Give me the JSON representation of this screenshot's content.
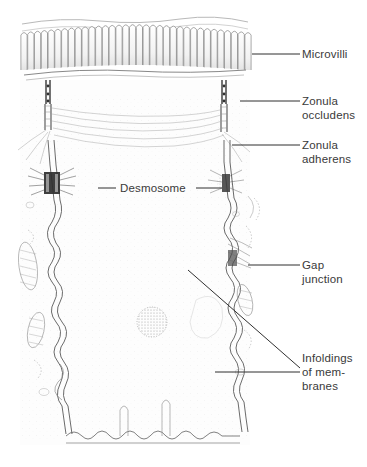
{
  "figure": {
    "background_color": "#ffffff",
    "ink_color": "#555555",
    "label_color": "#3a3a3a",
    "width": 367,
    "height": 467
  },
  "labels": {
    "microvilli": "Microvilli",
    "zonula_occludens": "Zonula\noccludens",
    "zonula_adherens": "Zonula\nadherens",
    "desmosome": "Desmosome",
    "gap_junction": "Gap\njunction",
    "infoldings": "Infoldings\nof mem-\nbranes"
  },
  "leader_lines": [
    {
      "name": "microvilli-leader",
      "x1": 252,
      "y1": 54,
      "x2": 300,
      "y2": 54
    },
    {
      "name": "zonula-occludens-leader",
      "x1": 240,
      "y1": 101,
      "x2": 300,
      "y2": 101
    },
    {
      "name": "zonula-adherens-leader",
      "x1": 232,
      "y1": 145,
      "x2": 300,
      "y2": 145
    },
    {
      "name": "desmosome-leader-left",
      "x1": 105,
      "y1": 188,
      "x2": 116,
      "y2": 188
    },
    {
      "name": "desmosome-leader-right",
      "x1": 196,
      "y1": 188,
      "x2": 222,
      "y2": 188
    },
    {
      "name": "gap-junction-leader",
      "x1": 248,
      "y1": 265,
      "x2": 300,
      "y2": 265
    },
    {
      "name": "infoldings-leader-upper",
      "x1": 188,
      "y1": 270,
      "x2": 300,
      "y2": 368
    },
    {
      "name": "infoldings-leader-lower",
      "x1": 215,
      "y1": 372,
      "x2": 300,
      "y2": 372
    }
  ],
  "structures": {
    "apical_surface": "microvilli-brush-border",
    "lateral_membranes": "interdigitating-cell-borders",
    "basal_surface": "basal-membrane-infoldings",
    "organelles": [
      "mitochondria",
      "rough-endoplasmic-reticulum",
      "lysosome",
      "vesicles"
    ],
    "junction_count": {
      "desmosomes": 2,
      "gap_junctions": 1,
      "tight_junctions": 1
    }
  }
}
